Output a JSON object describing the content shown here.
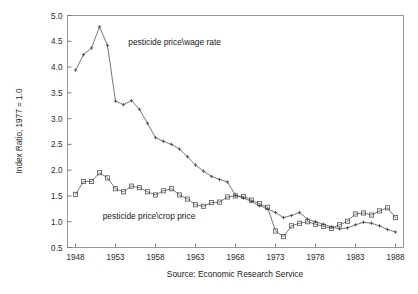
{
  "chart_data": {
    "type": "line",
    "title": "",
    "xlabel": "",
    "ylabel": "Index Ratio, 1977 = 1.0",
    "source_note": "Source: Economic Research Service",
    "xlim": [
      1947,
      1989
    ],
    "ylim": [
      0.5,
      5.0
    ],
    "grid": false,
    "legend_position": "inline-annotations",
    "x_tick_labels": [
      "1948",
      "1953",
      "1958",
      "1963",
      "1968",
      "1973",
      "1978",
      "1983",
      "1988"
    ],
    "x_tick_values": [
      1948,
      1953,
      1958,
      1963,
      1968,
      1973,
      1978,
      1983,
      1988
    ],
    "y_tick_labels": [
      "0.5",
      "1.0",
      "1.5",
      "2.0",
      "2.5",
      "3.0",
      "3.5",
      "4.0",
      "4.5",
      "5.0"
    ],
    "y_tick_values": [
      0.5,
      1.0,
      1.5,
      2.0,
      2.5,
      3.0,
      3.5,
      4.0,
      4.5,
      5.0
    ],
    "x": [
      1948,
      1949,
      1950,
      1951,
      1952,
      1953,
      1954,
      1955,
      1956,
      1957,
      1958,
      1959,
      1960,
      1961,
      1962,
      1963,
      1964,
      1965,
      1966,
      1967,
      1968,
      1969,
      1970,
      1971,
      1972,
      1973,
      1974,
      1975,
      1976,
      1977,
      1978,
      1979,
      1980,
      1981,
      1982,
      1983,
      1984,
      1985,
      1986,
      1987,
      1988
    ],
    "series": [
      {
        "name": "pesticide price\\wage rate",
        "marker": "plus",
        "annotation": "pesticide price\\wage rate",
        "annotation_x": 1954.6,
        "annotation_y": 4.42,
        "values": [
          3.94,
          4.24,
          4.37,
          4.78,
          4.42,
          3.34,
          3.27,
          3.35,
          3.18,
          2.91,
          2.63,
          2.56,
          2.5,
          2.41,
          2.26,
          2.1,
          1.98,
          1.88,
          1.82,
          1.77,
          1.51,
          1.46,
          1.39,
          1.31,
          1.25,
          1.18,
          1.08,
          1.12,
          1.18,
          1.05,
          1.0,
          0.95,
          0.9,
          0.86,
          0.88,
          0.94,
          0.99,
          0.97,
          0.92,
          0.85,
          0.8
        ]
      },
      {
        "name": "pesticide price\\crop price",
        "marker": "square",
        "annotation": "pesticide price\\crop price",
        "annotation_x": 1951.4,
        "annotation_y": 1.05,
        "values": [
          1.53,
          1.78,
          1.78,
          1.95,
          1.85,
          1.64,
          1.58,
          1.69,
          1.66,
          1.58,
          1.52,
          1.6,
          1.64,
          1.52,
          1.44,
          1.33,
          1.3,
          1.37,
          1.38,
          1.48,
          1.5,
          1.49,
          1.42,
          1.35,
          1.28,
          0.82,
          0.71,
          0.92,
          0.97,
          1.0,
          0.95,
          0.91,
          0.87,
          0.94,
          1.01,
          1.15,
          1.17,
          1.13,
          1.21,
          1.27,
          1.08
        ]
      }
    ]
  },
  "figure": {
    "y_axis_title": "Index Ratio, 1977 = 1.0",
    "source_caption": "Source: Economic Research Service",
    "annotation_wage": "pesticide price\\wage rate",
    "annotation_crop": "pesticide price\\crop price"
  },
  "colors": {
    "background": "#ffffff",
    "frame": "#8a8a8a",
    "line": "#555555",
    "text": "#1a1a1a"
  }
}
